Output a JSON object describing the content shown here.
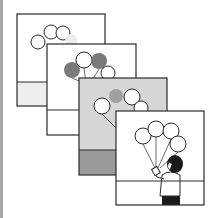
{
  "colors": {
    "page_bg": "#ffffff",
    "left_bar": "#a8a8a8",
    "line": "#2a2a2a",
    "white": "#ffffff",
    "light_gray": "#ededed",
    "mid_gray": "#d6d6d6",
    "dark_gray": "#9a9a9a",
    "balloon_gray": "#7a7a7a",
    "balloon_pink_gray": "#a0a0a0",
    "hair": "#1a1a1a"
  },
  "panels": [
    {
      "id": "frame-1",
      "x": 17,
      "y": 14,
      "w": 88,
      "h": 92,
      "horizon": 68,
      "sky": "#ffffff",
      "ground": "#ededed",
      "balloons": [
        {
          "cx": 38,
          "cy": 42,
          "r": 7,
          "fill": "#ffffff"
        },
        {
          "cx": 51,
          "cy": 32,
          "r": 7,
          "fill": "#ffffff"
        },
        {
          "cx": 63,
          "cy": 33,
          "r": 7,
          "fill": "#ffffff"
        },
        {
          "cx": 71,
          "cy": 40,
          "r": 6,
          "fill": "#ededed"
        }
      ]
    },
    {
      "id": "frame-2",
      "x": 47,
      "y": 44,
      "w": 89,
      "h": 91,
      "horizon": 66,
      "sky": "#ffffff",
      "ground": "#ffffff",
      "balloons": [
        {
          "cx": 72,
          "cy": 70,
          "r": 8,
          "fill": "#7a7a7a"
        },
        {
          "cx": 84,
          "cy": 60,
          "r": 8,
          "fill": "#ffffff"
        },
        {
          "cx": 99,
          "cy": 61,
          "r": 8,
          "fill": "#7a7a7a"
        },
        {
          "cx": 108,
          "cy": 73,
          "r": 7,
          "fill": "#ffffff"
        }
      ],
      "strings": [
        {
          "x1": 72,
          "y1": 78,
          "x2": 86,
          "y2": 84
        },
        {
          "x1": 84,
          "y1": 68,
          "x2": 86,
          "y2": 84
        },
        {
          "x1": 99,
          "y1": 69,
          "x2": 90,
          "y2": 84
        },
        {
          "x1": 108,
          "y1": 80,
          "x2": 92,
          "y2": 84
        }
      ]
    },
    {
      "id": "frame-3",
      "x": 79,
      "y": 78,
      "w": 88,
      "h": 97,
      "horizon": 72,
      "sky": "#d6d6d6",
      "ground": "#9a9a9a",
      "balloons": [
        {
          "cx": 102,
          "cy": 106,
          "r": 8,
          "fill": "#ffffff"
        },
        {
          "cx": 116,
          "cy": 96,
          "r": 7,
          "fill": "#a0a0a0"
        },
        {
          "cx": 132,
          "cy": 97,
          "r": 8,
          "fill": "#ffffff"
        },
        {
          "cx": 141,
          "cy": 108,
          "r": 7,
          "fill": "#ffffff"
        }
      ],
      "strings": [
        {
          "x1": 102,
          "y1": 114,
          "x2": 118,
          "y2": 130
        },
        {
          "x1": 118,
          "y1": 130,
          "x2": 118,
          "y2": 140
        }
      ]
    },
    {
      "id": "frame-4",
      "x": 116,
      "y": 111,
      "w": 88,
      "h": 94,
      "horizon": 70,
      "sky": "#ffffff",
      "ground": "#ffffff",
      "balloons": [
        {
          "cx": 143,
          "cy": 136,
          "r": 8,
          "fill": "#ffffff"
        },
        {
          "cx": 156,
          "cy": 129,
          "r": 8,
          "fill": "#ffffff"
        },
        {
          "cx": 171,
          "cy": 131,
          "r": 8,
          "fill": "#ffffff"
        },
        {
          "cx": 178,
          "cy": 144,
          "r": 8,
          "fill": "#ffffff"
        }
      ],
      "strings": [
        {
          "x1": 143,
          "y1": 144,
          "x2": 155,
          "y2": 168
        },
        {
          "x1": 156,
          "y1": 137,
          "x2": 156,
          "y2": 168
        },
        {
          "x1": 171,
          "y1": 139,
          "x2": 158,
          "y2": 168
        },
        {
          "x1": 178,
          "y1": 152,
          "x2": 160,
          "y2": 168
        }
      ]
    }
  ],
  "figure": {
    "hair": {
      "cx": 175,
      "cy": 164,
      "rx": 8,
      "ry": 9
    },
    "torso": {
      "x": 160,
      "y": 171,
      "w": 20,
      "h": 25
    },
    "skirt": {
      "x": 162,
      "y": 196,
      "w": 18,
      "h": 9
    },
    "hands": {
      "cx": 157,
      "cy": 171
    }
  }
}
